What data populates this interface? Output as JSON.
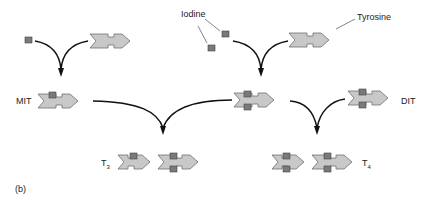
{
  "diagram": {
    "panel_label": "(b)",
    "labels": {
      "iodine": "Iodine",
      "tyrosine": "Tyrosine",
      "mit": "MIT",
      "dit": "DIT",
      "t3_main": "T",
      "t3_sub": "3",
      "t4_main": "T",
      "t4_sub": "4"
    },
    "colors": {
      "molecule_fill": "#c8c8c8",
      "molecule_stroke": "#6e6e6e",
      "iodine_fill": "#7a7a7a",
      "iodine_stroke": "#444444",
      "arrow": "#111111"
    }
  }
}
